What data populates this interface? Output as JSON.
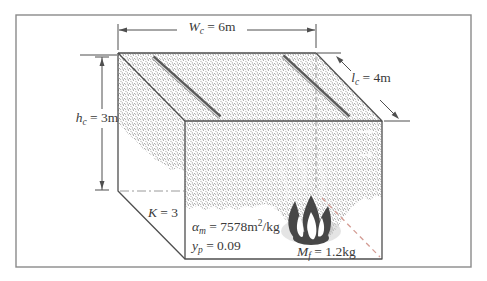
{
  "figure": {
    "type": "fire-compartment-diagram",
    "dimension_labels": {
      "width": {
        "symbol": "W",
        "subscript": "c",
        "rest": " = 6m"
      },
      "depth": {
        "symbol": "l",
        "subscript": "c",
        "rest": " = 4m"
      },
      "height": {
        "symbol": "h",
        "subscript": "c",
        "rest": " = 3m"
      }
    },
    "parameter_labels": {
      "k": {
        "symbol": "K",
        "rest": " = 3"
      },
      "alpha": {
        "symbol": "α",
        "subscript": "m",
        "mid": " = 7578m",
        "superscript": "2",
        "rest": "/kg"
      },
      "yp": {
        "symbol": "y",
        "subscript": "p",
        "rest": " = 0.09"
      },
      "mf": {
        "symbol": "M",
        "subscript": "f",
        "rest": " = 1.2kg"
      }
    },
    "colors": {
      "edge": "#4f4f4f",
      "stipple_dot": "#8e8e8e",
      "hidden_line": "#9a9a9a",
      "hidden_line_accent": "#d49c94",
      "flame": "#474747",
      "text": "#3a3a3a",
      "frame": "#8a8a8a"
    }
  }
}
